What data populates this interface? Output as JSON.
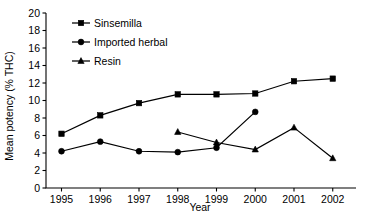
{
  "chart_data": {
    "type": "line",
    "title": "",
    "xlabel": "Year",
    "ylabel": "Mean potency (% THC)",
    "x": [
      1995,
      1996,
      1997,
      1998,
      1999,
      2000,
      2001,
      2002
    ],
    "categories": [
      "1995",
      "1996",
      "1997",
      "1998",
      "1999",
      "2000",
      "2001",
      "2002"
    ],
    "xlim": [
      1994.6,
      2002.6
    ],
    "ylim": [
      0,
      20
    ],
    "yticks": [
      0,
      2,
      4,
      6,
      8,
      10,
      12,
      14,
      16,
      18,
      20
    ],
    "ytick_labels": [
      "0",
      "2",
      "4",
      "6",
      "8",
      "10",
      "12",
      "14",
      "16",
      "18",
      "20"
    ],
    "xticks": [
      1995,
      1996,
      1997,
      1998,
      1999,
      2000,
      2001,
      2002
    ],
    "xtick_labels": [
      "1995",
      "1996",
      "1997",
      "1998",
      "1999",
      "2000",
      "2001",
      "2002"
    ],
    "grid": false,
    "legend_position": "upper-left-inside",
    "line_color": "#000000",
    "series": [
      {
        "name": "Sinsemilla",
        "marker": "square",
        "color": "#000000",
        "x": [
          1995,
          1996,
          1997,
          1998,
          1999,
          2000,
          2001,
          2002
        ],
        "values": [
          6.2,
          8.3,
          9.7,
          10.7,
          10.7,
          10.8,
          12.2,
          12.5
        ]
      },
      {
        "name": "Imported herbal",
        "marker": "circle",
        "color": "#000000",
        "x": [
          1995,
          1996,
          1997,
          1998,
          1999,
          2000
        ],
        "values": [
          4.2,
          5.3,
          4.2,
          4.1,
          4.6,
          8.7
        ]
      },
      {
        "name": "Resin",
        "marker": "triangle",
        "color": "#000000",
        "x": [
          1998,
          1999,
          2000,
          2001,
          2002
        ],
        "values": [
          6.4,
          5.2,
          4.4,
          6.9,
          3.4
        ]
      }
    ]
  },
  "legend": {
    "entries": [
      {
        "label": "Sinsemilla",
        "marker": "square"
      },
      {
        "label": "Imported herbal",
        "marker": "circle"
      },
      {
        "label": "Resin",
        "marker": "triangle"
      }
    ]
  },
  "axes": {
    "y_title": "Mean potency (% THC)",
    "x_title": "Year"
  }
}
